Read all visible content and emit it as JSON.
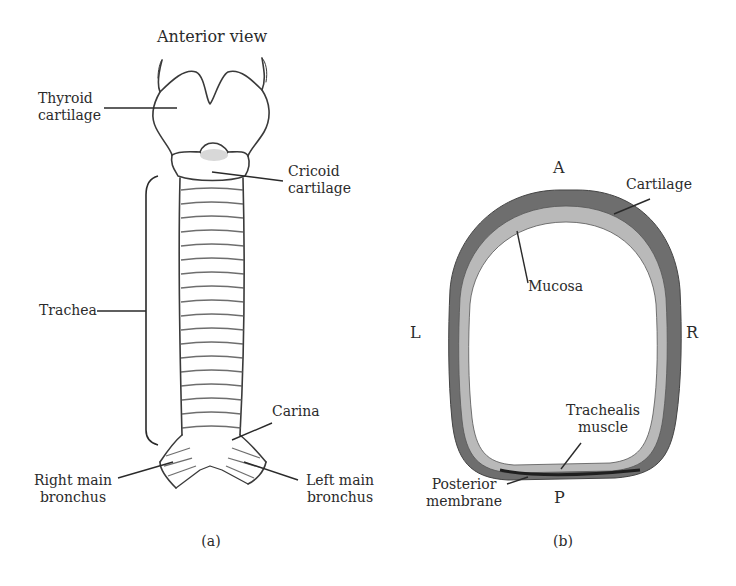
{
  "panel_a": {
    "title": "Anterior view",
    "labels": {
      "thyroid_1": "Thyroid",
      "thyroid_2": "cartilage",
      "cricoid_1": "Cricoid",
      "cricoid_2": "cartilage",
      "trachea": "Trachea",
      "carina": "Carina",
      "right_bronchus_1": "Right main",
      "right_bronchus_2": "bronchus",
      "left_bronchus_1": "Left main",
      "left_bronchus_2": "bronchus"
    },
    "caption": "(a)"
  },
  "panel_b": {
    "orientation": {
      "anterior": "A",
      "posterior": "P",
      "left": "L",
      "right": "R"
    },
    "labels": {
      "cartilage": "Cartilage",
      "mucosa": "Mucosa",
      "trachealis_1": "Trachealis",
      "trachealis_2": "muscle",
      "posterior_1": "Posterior",
      "posterior_2": "membrane"
    },
    "caption": "(b)"
  },
  "colors": {
    "cartilage": "#6e6e6e",
    "mucosa": "#b9b9b9",
    "line": "#333333"
  }
}
